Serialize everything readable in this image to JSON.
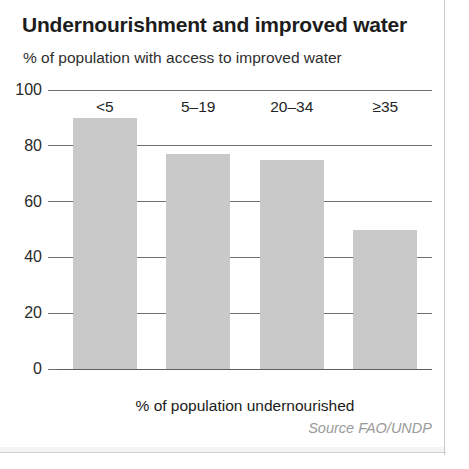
{
  "chart_data": {
    "type": "bar",
    "title": "Undernourishment and improved water",
    "subtitle": "% of population with access to improved water",
    "xlabel": "% of population undernourished",
    "ylabel": "% of population with access to improved water",
    "categories": [
      "<5",
      "5–19",
      "20–34",
      "≥35"
    ],
    "values": [
      90,
      77,
      75,
      50
    ],
    "series": [
      {
        "name": "% of population with access to improved water",
        "values": [
          90,
          77,
          75,
          50
        ]
      }
    ],
    "ylim": [
      0,
      100
    ],
    "yticks": [
      0,
      20,
      40,
      60,
      80,
      100
    ],
    "ytick_labels": [
      "0",
      "20",
      "40",
      "60",
      "80",
      "100"
    ],
    "grid": true,
    "grid_axis": "y",
    "legend": false,
    "legend_position": "none",
    "source": "Source FAO/UNDP",
    "bar_color": "#c9c9c9",
    "axis_color": "#6f6f6f",
    "text_color": "#1d1d1d",
    "source_color": "#9a9a9a",
    "background": "#ffffff"
  }
}
